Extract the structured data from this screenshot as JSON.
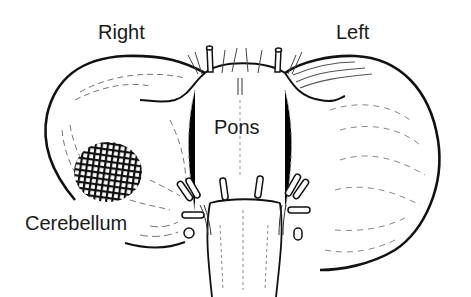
{
  "diagram": {
    "labels": {
      "right": "Right",
      "left": "Left",
      "pons": "Pons",
      "cerebellum": "Cerebellum"
    },
    "highlight": {
      "description": "crosshatched lesion on right cerebellar hemisphere",
      "pattern": "crosshatch"
    },
    "colors": {
      "ink": "#1a1a1a",
      "background": "#ffffff",
      "shading": "#6b6b6b"
    }
  }
}
